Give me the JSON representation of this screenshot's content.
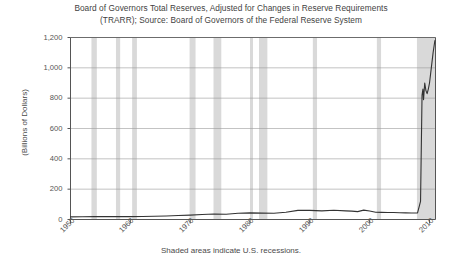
{
  "chart_data": {
    "type": "line",
    "title": "Board of Governors Total Reserves, Adjusted for Changes in Reserve Requirements",
    "subtitle": "(TRARR); Source: Board of Governors of the Federal Reserve System",
    "title_line1": "Board of Governors Total Reserves, Adjusted for Changes in Reserve Requirements",
    "title_line2": "(TRARR); Source: Board of Governors of the Federal Reserve System",
    "xlabel": "",
    "ylabel": "(Billions of Dollars)",
    "footnote": "Shaded areas indicate U.S. recessions.",
    "grid": true,
    "legend": "none",
    "xlim": [
      1950,
      2011
    ],
    "ylim": [
      0,
      1200
    ],
    "yticks": [
      0,
      200,
      400,
      600,
      800,
      1000,
      1200
    ],
    "ytick_labels": [
      "0",
      "200",
      "400",
      "600",
      "800",
      "1,000",
      "1,200"
    ],
    "xticks": [
      1950,
      1960,
      1970,
      1980,
      1990,
      2000,
      2010
    ],
    "xtick_labels": [
      "1950",
      "1960",
      "1970",
      "1980",
      "1990",
      "2000",
      "2010"
    ],
    "line_color": "#333333",
    "shade_color": "#d9d9d9",
    "series": [
      {
        "name": "Total Reserves Adjusted (TRARR)",
        "x": [
          1950,
          1952,
          1954,
          1956,
          1958,
          1960,
          1962,
          1964,
          1966,
          1968,
          1970,
          1972,
          1974,
          1976,
          1978,
          1980,
          1982,
          1984,
          1986,
          1988,
          1990,
          1992,
          1994,
          1996,
          1997,
          1998,
          1999,
          2000,
          2001,
          2002,
          2003,
          2004,
          2005,
          2006,
          2007,
          2008.0,
          2008.5,
          2008.75,
          2008.9,
          2009.0,
          2009.2,
          2009.4,
          2009.6,
          2009.8,
          2010.0,
          2010.3,
          2010.6,
          2010.9
        ],
        "values": [
          17,
          18,
          19,
          19,
          19,
          19,
          20,
          21,
          23,
          26,
          29,
          33,
          36,
          35,
          41,
          44,
          42,
          41,
          48,
          60,
          60,
          57,
          61,
          57,
          55,
          52,
          62,
          56,
          48,
          47,
          46,
          46,
          45,
          44,
          43,
          44,
          120,
          820,
          860,
          790,
          900,
          850,
          830,
          860,
          900,
          1000,
          1100,
          1180
        ]
      }
    ],
    "recession_bands": [
      {
        "start": 1953.5,
        "end": 1954.4
      },
      {
        "start": 1957.6,
        "end": 1958.3
      },
      {
        "start": 1960.3,
        "end": 1961.1
      },
      {
        "start": 1969.9,
        "end": 1970.9
      },
      {
        "start": 1973.9,
        "end": 1975.2
      },
      {
        "start": 1980.0,
        "end": 1980.5
      },
      {
        "start": 1981.5,
        "end": 1982.9
      },
      {
        "start": 1990.5,
        "end": 1991.2
      },
      {
        "start": 2001.2,
        "end": 2001.9
      },
      {
        "start": 2007.9,
        "end": 2011.0
      }
    ]
  }
}
